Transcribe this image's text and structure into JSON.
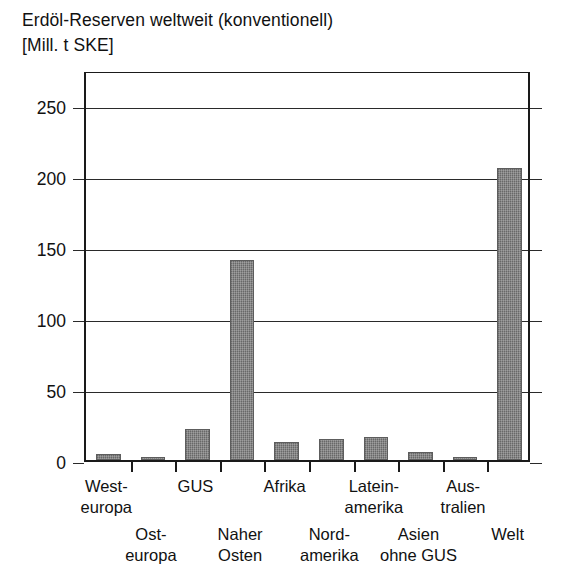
{
  "title": {
    "line1": "Erdöl-Reserven weltweit (konventionell)",
    "line2": "[Mill. t SKE]"
  },
  "chart_data": {
    "type": "bar",
    "title": "Erdöl-Reserven weltweit (konventionell)",
    "subtitle": "[Mill. t SKE]",
    "xlabel": "",
    "ylabel": "[Mill. t SKE]",
    "ylim": [
      0,
      275
    ],
    "yticks": [
      0,
      50,
      100,
      150,
      200,
      250
    ],
    "ytick_labels": [
      "0",
      "50",
      "100",
      "150",
      "200",
      "250"
    ],
    "grid": true,
    "legend": null,
    "bar_color": "#7c7c7c",
    "categories": [
      "West-europa",
      "Ost-europa",
      "GUS",
      "Naher Osten",
      "Afrika",
      "Nord-amerika",
      "Latein-amerika",
      "Asien ohne GUS",
      "Aus-tralien",
      "Welt"
    ],
    "category_lines": [
      [
        "West-",
        "europa"
      ],
      [
        "Ost-",
        "europa"
      ],
      [
        "GUS",
        ""
      ],
      [
        "Naher",
        "Osten"
      ],
      [
        "Afrika",
        ""
      ],
      [
        "Nord-",
        "amerika"
      ],
      [
        "Latein-",
        "amerika"
      ],
      [
        "Asien",
        "ohne GUS"
      ],
      [
        "Aus-",
        "tralien"
      ],
      [
        "Welt",
        ""
      ]
    ],
    "label_rows": [
      "top",
      "bottom",
      "top",
      "bottom",
      "top",
      "bottom",
      "top",
      "bottom",
      "top",
      "bottom"
    ],
    "values": [
      4,
      1,
      22,
      141,
      13,
      15,
      16,
      6,
      1,
      206
    ]
  }
}
